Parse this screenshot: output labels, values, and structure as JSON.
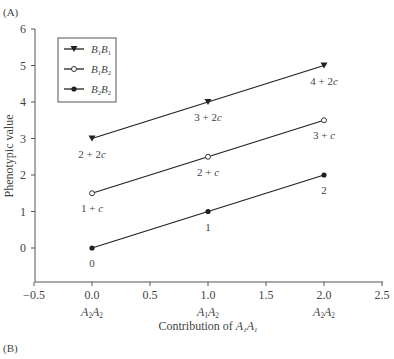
{
  "panel_labels": {
    "a": "(A)",
    "b": "(B)"
  },
  "chart_data": {
    "type": "line",
    "title": "",
    "xlabel": "Contribution of A1A1",
    "ylabel": "Phenotypic value",
    "xlim": [
      -0.5,
      2.5
    ],
    "ylim": [
      -0.5,
      6
    ],
    "x_ticks": [
      "-0.5",
      "0.0",
      "0.5",
      "1.0",
      "1.5",
      "2.0",
      "2.5"
    ],
    "y_ticks": [
      "0",
      "1",
      "2",
      "3",
      "4",
      "5",
      "6"
    ],
    "x_sublabels": [
      {
        "x": 0.0,
        "text": "A2A2"
      },
      {
        "x": 1.0,
        "text": "A1A2"
      },
      {
        "x": 2.0,
        "text": "A2A2"
      }
    ],
    "grid": false,
    "legend_position": "upper left",
    "x": [
      0,
      1,
      2
    ],
    "series": [
      {
        "name": "B1B1",
        "marker": "filled-triangle-down",
        "values": [
          3,
          4,
          5
        ],
        "point_labels": [
          "2 + 2c",
          "3 + 2c",
          "4 + 2c"
        ]
      },
      {
        "name": "B1B2",
        "marker": "open-circle",
        "values": [
          1.5,
          2.5,
          3.5
        ],
        "point_labels": [
          "1 + c",
          "2 + c",
          "3 + c"
        ]
      },
      {
        "name": "B2B2",
        "marker": "filled-circle",
        "values": [
          0,
          1,
          2
        ],
        "point_labels": [
          "0",
          "1",
          "2"
        ]
      }
    ]
  }
}
